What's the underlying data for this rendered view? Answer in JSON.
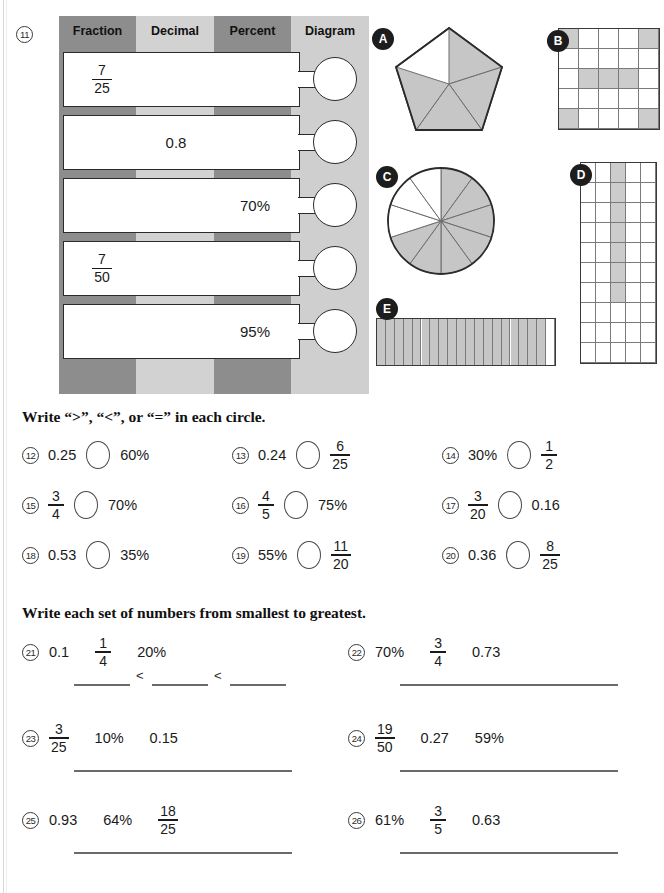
{
  "worksheet": {
    "q11": {
      "number": "11",
      "headers": [
        "Fraction",
        "Decimal",
        "Percent",
        "Diagram"
      ],
      "rows": [
        {
          "fraction_num": "7",
          "fraction_den": "25",
          "decimal": "",
          "percent": "",
          "diagram": ""
        },
        {
          "fraction_num": "",
          "fraction_den": "",
          "decimal": "0.8",
          "percent": "",
          "diagram": ""
        },
        {
          "fraction_num": "",
          "fraction_den": "",
          "decimal": "",
          "percent": "70%",
          "diagram": ""
        },
        {
          "fraction_num": "7",
          "fraction_den": "50",
          "decimal": "",
          "percent": "",
          "diagram": ""
        },
        {
          "fraction_num": "",
          "fraction_den": "",
          "decimal": "",
          "percent": "95%",
          "diagram": ""
        }
      ]
    },
    "diagrams": [
      {
        "label": "A",
        "type": "pentagon-sectors",
        "total": 5,
        "shaded": 4
      },
      {
        "label": "B",
        "type": "grid",
        "cols": 5,
        "rows": 5,
        "shaded": 7
      },
      {
        "label": "C",
        "type": "pie-sectors",
        "total": 10,
        "shaded": 7
      },
      {
        "label": "D",
        "type": "grid",
        "cols": 5,
        "rows": 10,
        "shaded": 7
      },
      {
        "label": "E",
        "type": "bar-segments",
        "total": 20,
        "shaded": 19
      }
    ],
    "compare": {
      "prompt": "Write “>”, “<”, or “=” in each circle.",
      "items": [
        {
          "number": "12",
          "left": {
            "kind": "text",
            "value": "0.25"
          },
          "right": {
            "kind": "text",
            "value": "60%"
          }
        },
        {
          "number": "13",
          "left": {
            "kind": "text",
            "value": "0.24"
          },
          "right": {
            "kind": "fraction",
            "num": "6",
            "den": "25"
          }
        },
        {
          "number": "14",
          "left": {
            "kind": "text",
            "value": "30%"
          },
          "right": {
            "kind": "fraction",
            "num": "1",
            "den": "2"
          }
        },
        {
          "number": "15",
          "left": {
            "kind": "fraction",
            "num": "3",
            "den": "4"
          },
          "right": {
            "kind": "text",
            "value": "70%"
          }
        },
        {
          "number": "16",
          "left": {
            "kind": "fraction",
            "num": "4",
            "den": "5"
          },
          "right": {
            "kind": "text",
            "value": "75%"
          }
        },
        {
          "number": "17",
          "left": {
            "kind": "fraction",
            "num": "3",
            "den": "20"
          },
          "right": {
            "kind": "text",
            "value": "0.16"
          }
        },
        {
          "number": "18",
          "left": {
            "kind": "text",
            "value": "0.53"
          },
          "right": {
            "kind": "text",
            "value": "35%"
          }
        },
        {
          "number": "19",
          "left": {
            "kind": "text",
            "value": "55%"
          },
          "right": {
            "kind": "fraction",
            "num": "11",
            "den": "20"
          }
        },
        {
          "number": "20",
          "left": {
            "kind": "text",
            "value": "0.36"
          },
          "right": {
            "kind": "fraction",
            "num": "8",
            "den": "25"
          }
        }
      ]
    },
    "ordering": {
      "prompt": "Write each set of numbers from smallest to greatest.",
      "separator": "<",
      "items": [
        {
          "number": "21",
          "values": [
            {
              "kind": "text",
              "value": "0.1"
            },
            {
              "kind": "fraction",
              "num": "1",
              "den": "4"
            },
            {
              "kind": "text",
              "value": "20%"
            }
          ]
        },
        {
          "number": "22",
          "values": [
            {
              "kind": "text",
              "value": "70%"
            },
            {
              "kind": "fraction",
              "num": "3",
              "den": "4"
            },
            {
              "kind": "text",
              "value": "0.73"
            }
          ]
        },
        {
          "number": "23",
          "values": [
            {
              "kind": "fraction",
              "num": "3",
              "den": "25"
            },
            {
              "kind": "text",
              "value": "10%"
            },
            {
              "kind": "text",
              "value": "0.15"
            }
          ]
        },
        {
          "number": "24",
          "values": [
            {
              "kind": "fraction",
              "num": "19",
              "den": "50"
            },
            {
              "kind": "text",
              "value": "0.27"
            },
            {
              "kind": "text",
              "value": "59%"
            }
          ]
        },
        {
          "number": "25",
          "values": [
            {
              "kind": "text",
              "value": "0.93"
            },
            {
              "kind": "text",
              "value": "64%"
            },
            {
              "kind": "fraction",
              "num": "18",
              "den": "25"
            }
          ]
        },
        {
          "number": "26",
          "values": [
            {
              "kind": "text",
              "value": "61%"
            },
            {
              "kind": "fraction",
              "num": "3",
              "den": "5"
            },
            {
              "kind": "text",
              "value": "0.63"
            }
          ]
        }
      ]
    },
    "colors": {
      "header_dark": "#8d8d8d",
      "header_light": "#d2d2d2",
      "table_bg": "#c9c9c9",
      "shade": "#cccccc",
      "ink": "#1a1a1a"
    }
  }
}
